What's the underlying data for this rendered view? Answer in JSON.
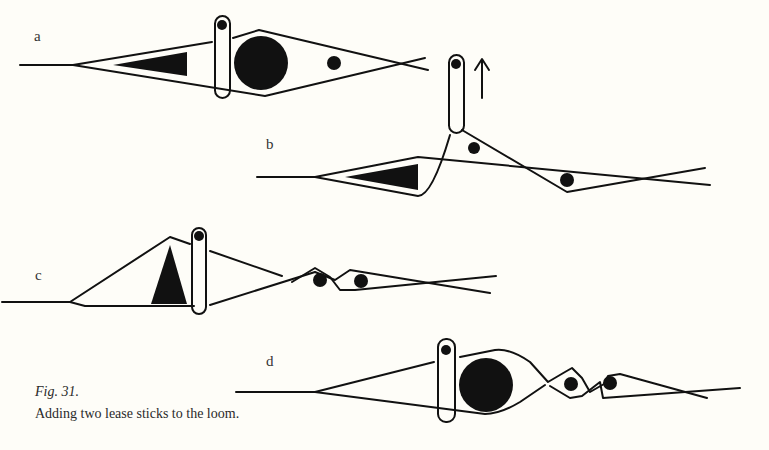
{
  "figure": {
    "number": "Fig. 31.",
    "caption": "Adding two lease sticks to the loom.",
    "panels": [
      {
        "id": "a",
        "label": "a",
        "description": "Shed with triangular shuttle, lease stick with cross rod, large round stick, small dot at the cross"
      },
      {
        "id": "b",
        "label": "b",
        "description": "Lease stick lifted upward (arrow) through the shed"
      },
      {
        "id": "c",
        "label": "c",
        "description": "Triangular stick turned on edge, lease stick inserted, two crosses with rods"
      },
      {
        "id": "d",
        "label": "d",
        "description": "Two lease sticks in place with large round stick and two crosses"
      }
    ],
    "arrow_direction": "up",
    "colors": {
      "ink": "#111111",
      "paper": "#fefdf8"
    }
  }
}
